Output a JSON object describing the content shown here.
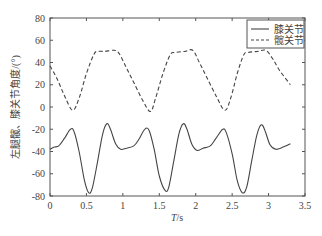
{
  "chart_data": {
    "type": "line",
    "title": "",
    "xlabel": "T/s",
    "ylabel": "左腿髋、膝关节角度/(°)",
    "xlim": [
      0,
      3.5
    ],
    "ylim": [
      -80,
      80
    ],
    "xticks": [
      0,
      0.5,
      1,
      1.5,
      2,
      2.5,
      3,
      3.5
    ],
    "xtick_labels": [
      "0",
      "0.5",
      "1",
      "1.5",
      "2",
      "2.5",
      "3",
      "3.5"
    ],
    "yticks": [
      -80,
      -60,
      -40,
      -20,
      0,
      20,
      40,
      60,
      80
    ],
    "ytick_labels": [
      "-80",
      "-60",
      "-40",
      "-20",
      "0",
      "20",
      "40",
      "60",
      "80"
    ],
    "grid": false,
    "legend_position": "upper right",
    "series": [
      {
        "name": "膝关节",
        "style": "solid",
        "x": [
          0,
          0.06,
          0.12,
          0.2,
          0.28,
          0.33,
          0.4,
          0.47,
          0.53,
          0.58,
          0.65,
          0.72,
          0.78,
          0.83,
          0.9,
          0.97,
          1.05,
          1.15,
          1.22,
          1.3,
          1.36,
          1.43,
          1.5,
          1.58,
          1.63,
          1.7,
          1.77,
          1.83,
          1.88,
          1.95,
          2.02,
          2.1,
          2.2,
          2.28,
          2.37,
          2.42,
          2.5,
          2.57,
          2.64,
          2.7,
          2.77,
          2.84,
          2.9,
          2.95,
          3.02,
          3.1,
          3.2,
          3.3
        ],
        "values": [
          -38,
          -36,
          -35,
          -28,
          -20,
          -22,
          -40,
          -65,
          -77,
          -73,
          -50,
          -25,
          -15,
          -20,
          -33,
          -38,
          -37,
          -35,
          -29,
          -20,
          -21,
          -38,
          -62,
          -75,
          -72,
          -48,
          -24,
          -15,
          -20,
          -34,
          -39,
          -37,
          -35,
          -28,
          -20,
          -23,
          -42,
          -66,
          -77,
          -72,
          -48,
          -25,
          -16,
          -21,
          -34,
          -38,
          -36,
          -33
        ]
      },
      {
        "name": "髋关节",
        "style": "dashed",
        "x": [
          0,
          0.1,
          0.2,
          0.31,
          0.4,
          0.5,
          0.6,
          0.65,
          0.75,
          0.88,
          0.95,
          1.05,
          1.15,
          1.28,
          1.38,
          1.45,
          1.55,
          1.65,
          1.72,
          1.85,
          1.96,
          2.05,
          2.15,
          2.28,
          2.4,
          2.48,
          2.57,
          2.66,
          2.72,
          2.85,
          2.96,
          3.05,
          3.15,
          3.3
        ],
        "values": [
          37,
          25,
          10,
          -3,
          8,
          30,
          47,
          50,
          50,
          51,
          48,
          35,
          22,
          5,
          -4,
          8,
          30,
          47,
          49,
          50,
          51,
          40,
          27,
          10,
          -3,
          8,
          30,
          47,
          49,
          50,
          51,
          44,
          33,
          20
        ]
      }
    ]
  }
}
